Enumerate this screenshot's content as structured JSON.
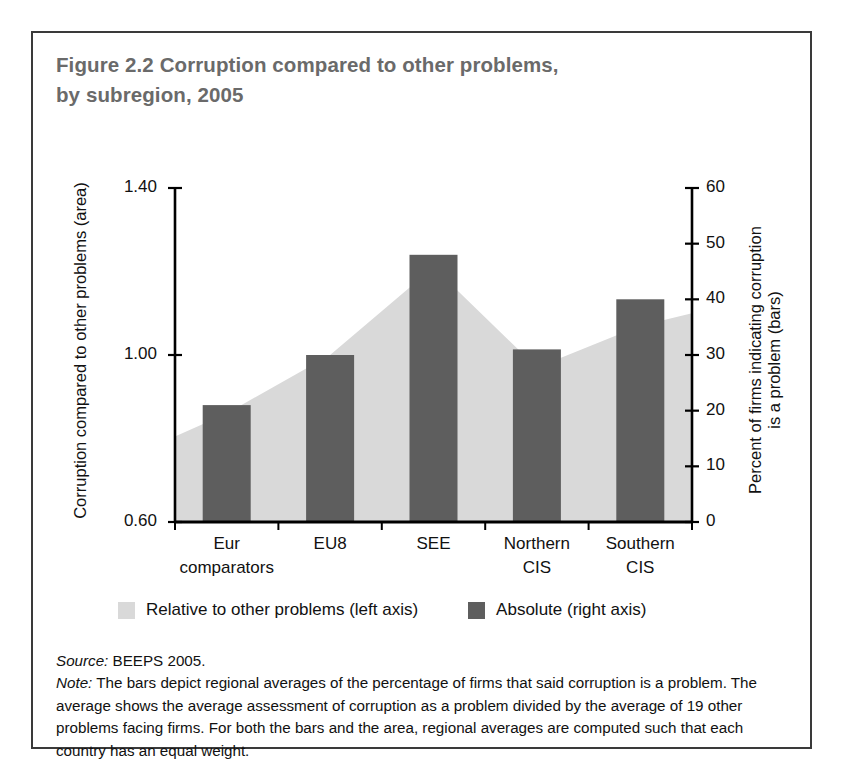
{
  "figure": {
    "title_line1": "Figure 2.2  Corruption compared to other problems,",
    "title_line2": "by subregion, 2005",
    "source": "Source:",
    "source_text": " BEEPS 2005.",
    "note_label": "Note:",
    "note_text": " The bars depict regional averages of the percentage of firms that said corruption is a problem. The average shows the average assessment of corruption as a problem divided by the average of 19 other problems facing firms. For both the bars and the area, regional averages are computed such that each country has an equal weight."
  },
  "legend": {
    "area_label": "Relative to other problems (left axis)",
    "bar_label": "Absolute (right axis)",
    "area_color": "#d9d9d9",
    "bar_color": "#5e5e5e"
  },
  "axes": {
    "left_title": "Corruption compared to other problems (area)",
    "right_title_line1": "Percent of firms indicating corruption",
    "right_title_line2": "is a problem (bars)",
    "left_ticks": [
      "1.40",
      "1.00",
      "0.60"
    ],
    "right_ticks": [
      "60",
      "50",
      "40",
      "30",
      "20",
      "10",
      "0"
    ]
  },
  "chart_data": {
    "type": "bar",
    "title": "Figure 2.2  Corruption compared to other problems, by subregion, 2005",
    "categories": [
      "Eur comparators",
      "EU8",
      "SEE",
      "Northern CIS",
      "Southern CIS"
    ],
    "category_lines": [
      [
        "Eur",
        "comparators"
      ],
      [
        "EU8",
        ""
      ],
      [
        "SEE",
        ""
      ],
      [
        "Northern",
        "CIS"
      ],
      [
        "Southern",
        "CIS"
      ]
    ],
    "series": [
      {
        "name": "Absolute (right axis)",
        "type": "bar",
        "axis": "right",
        "values": [
          21,
          30,
          48,
          31,
          40
        ],
        "color": "#5e5e5e"
      },
      {
        "name": "Relative to other problems (left axis)",
        "type": "area",
        "axis": "left",
        "values": [
          0.86,
          1.0,
          1.21,
          0.97,
          1.07
        ],
        "edge_start": 0.805,
        "edge_end": 1.1,
        "color": "#d9d9d9"
      }
    ],
    "xlabel": "",
    "ylabel": "Corruption compared to other problems (area)",
    "ylabel_right": "Percent of firms indicating corruption is a problem (bars)",
    "ylim": [
      0.6,
      1.4
    ],
    "ylim_right": [
      0,
      60
    ],
    "ytick_values": [
      1.4,
      1.0,
      0.6
    ],
    "ytick_values_right": [
      0,
      10,
      20,
      30,
      40,
      50,
      60
    ],
    "grid": false,
    "legend_position": "bottom"
  }
}
